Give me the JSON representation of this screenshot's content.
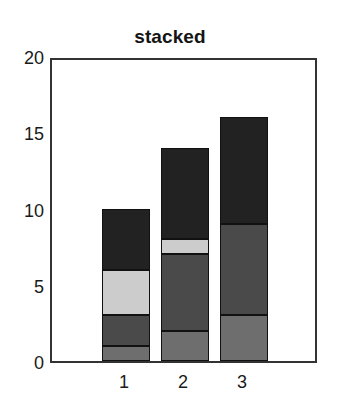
{
  "chart_data": {
    "type": "bar",
    "subtype": "stacked",
    "title": "stacked",
    "xlabel": "",
    "ylabel": "",
    "categories": [
      "1",
      "2",
      "3"
    ],
    "series": [
      {
        "name": "series-1",
        "values": [
          1,
          2,
          3
        ],
        "color": "#6e6e6e"
      },
      {
        "name": "series-2",
        "values": [
          2,
          5,
          6
        ],
        "color": "#4a4a4a"
      },
      {
        "name": "series-3",
        "values": [
          3,
          1,
          0
        ],
        "color": "#cccccc"
      },
      {
        "name": "series-4",
        "values": [
          4,
          6,
          7
        ],
        "color": "#222222"
      }
    ],
    "totals": [
      10,
      14,
      16
    ],
    "ylim": [
      0,
      20
    ],
    "xlim": [
      0.4,
      3.6
    ],
    "yticks": [
      0,
      5,
      10,
      15,
      20
    ],
    "ytick_labels": [
      "0",
      "5",
      "10",
      "15",
      "20"
    ],
    "xtick_labels": [
      "1",
      "2",
      "3"
    ],
    "grid": false,
    "legend": false,
    "frame": true,
    "frame_color": "#333333",
    "background": "#ffffff"
  },
  "axes": {
    "y_ticks": [
      {
        "label": "20",
        "value": 20
      },
      {
        "label": "15",
        "value": 15
      },
      {
        "label": "10",
        "value": 10
      },
      {
        "label": "5",
        "value": 5
      },
      {
        "label": "0",
        "value": 0
      }
    ],
    "x_ticks": [
      {
        "label": "1",
        "value": 1
      },
      {
        "label": "2",
        "value": 2
      },
      {
        "label": "3",
        "value": 3
      }
    ]
  }
}
